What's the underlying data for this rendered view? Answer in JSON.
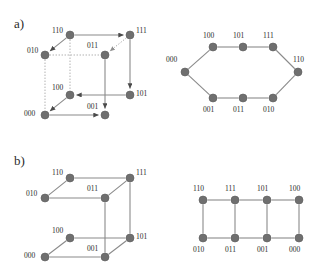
{
  "figure": {
    "width": 322,
    "height": 268,
    "background": "#ffffff",
    "node_color": "#6f6f6f",
    "edge_color": "#8a8a8a",
    "dotted_edge_color": "#a8a8a8",
    "text_color": "#2b2b2b"
  },
  "panels": {
    "a": {
      "label": "a)"
    },
    "b": {
      "label": "b)"
    }
  },
  "chart_data": [
    {
      "type": "diagram",
      "name": "panel-a-cube",
      "title": "a) directed hypercube Q3 with Hamiltonian path",
      "panel": "a",
      "position": "top-left",
      "nodes": [
        {
          "id": "110",
          "label": "110",
          "x": 70,
          "y": 35,
          "label_x": 52,
          "label_y": 33
        },
        {
          "id": "111",
          "label": "111",
          "x": 130,
          "y": 35,
          "label_x": 136,
          "label_y": 33
        },
        {
          "id": "010",
          "label": "010",
          "x": 45,
          "y": 55,
          "label_x": 27,
          "label_y": 53
        },
        {
          "id": "011",
          "label": "011",
          "x": 105,
          "y": 55,
          "label_x": 87,
          "label_y": 48
        },
        {
          "id": "100",
          "label": "100",
          "x": 70,
          "y": 95,
          "label_x": 52,
          "label_y": 90
        },
        {
          "id": "101",
          "label": "101",
          "x": 130,
          "y": 95,
          "label_x": 136,
          "label_y": 96
        },
        {
          "id": "000",
          "label": "000",
          "x": 45,
          "y": 115,
          "label_x": 24,
          "label_y": 116
        },
        {
          "id": "001",
          "label": "001",
          "x": 105,
          "y": 115,
          "label_x": 87,
          "label_y": 109
        }
      ],
      "edges": [
        {
          "from": "110",
          "to": "111",
          "style": "solid",
          "arrow": true
        },
        {
          "from": "110",
          "to": "010",
          "style": "solid",
          "arrow": true
        },
        {
          "from": "111",
          "to": "011",
          "style": "dotted",
          "arrow": true
        },
        {
          "from": "111",
          "to": "101",
          "style": "solid",
          "arrow": true
        },
        {
          "from": "011",
          "to": "001",
          "style": "solid",
          "arrow": true
        },
        {
          "from": "101",
          "to": "100",
          "style": "solid",
          "arrow": true
        },
        {
          "from": "100",
          "to": "000",
          "style": "solid",
          "arrow": true
        },
        {
          "from": "000",
          "to": "001",
          "style": "solid",
          "arrow": true
        },
        {
          "from": "010",
          "to": "000",
          "style": "dotted",
          "arrow": false
        },
        {
          "from": "110",
          "to": "100",
          "style": "dotted",
          "arrow": false
        },
        {
          "from": "010",
          "to": "011",
          "style": "dotted",
          "arrow": false
        }
      ]
    },
    {
      "type": "diagram",
      "name": "panel-a-hexagon",
      "title": "a) unfolded cycle view",
      "panel": "a",
      "position": "top-right",
      "nodes": [
        {
          "id": "000",
          "label": "000",
          "x": 185,
          "y": 72,
          "label_x": 166,
          "label_y": 62
        },
        {
          "id": "100",
          "label": "100",
          "x": 213,
          "y": 47,
          "label_x": 203,
          "label_y": 38
        },
        {
          "id": "101",
          "label": "101",
          "x": 243,
          "y": 47,
          "label_x": 233,
          "label_y": 38
        },
        {
          "id": "111",
          "label": "111",
          "x": 273,
          "y": 47,
          "label_x": 263,
          "label_y": 38
        },
        {
          "id": "110",
          "label": "110",
          "x": 298,
          "y": 72,
          "label_x": 293,
          "label_y": 62
        },
        {
          "id": "010",
          "label": "010",
          "x": 273,
          "y": 98,
          "label_x": 263,
          "label_y": 112
        },
        {
          "id": "011",
          "label": "011",
          "x": 243,
          "y": 98,
          "label_x": 233,
          "label_y": 112
        },
        {
          "id": "001",
          "label": "001",
          "x": 213,
          "y": 98,
          "label_x": 203,
          "label_y": 112
        }
      ],
      "edges": [
        {
          "from": "000",
          "to": "100",
          "style": "solid",
          "arrow": false
        },
        {
          "from": "100",
          "to": "101",
          "style": "solid",
          "arrow": false
        },
        {
          "from": "101",
          "to": "111",
          "style": "solid",
          "arrow": false
        },
        {
          "from": "111",
          "to": "110",
          "style": "solid",
          "arrow": false
        },
        {
          "from": "110",
          "to": "010",
          "style": "solid",
          "arrow": false
        },
        {
          "from": "010",
          "to": "011",
          "style": "solid",
          "arrow": false
        },
        {
          "from": "011",
          "to": "001",
          "style": "solid",
          "arrow": false
        },
        {
          "from": "001",
          "to": "000",
          "style": "solid",
          "arrow": false
        }
      ]
    },
    {
      "type": "diagram",
      "name": "panel-b-cube",
      "title": "b) cube with four edges removed",
      "panel": "b",
      "position": "bottom-left",
      "nodes": [
        {
          "id": "110",
          "label": "110",
          "x": 70,
          "y": 178,
          "label_x": 52,
          "label_y": 175
        },
        {
          "id": "111",
          "label": "111",
          "x": 130,
          "y": 178,
          "label_x": 136,
          "label_y": 175
        },
        {
          "id": "010",
          "label": "010",
          "x": 45,
          "y": 198,
          "label_x": 26,
          "label_y": 196
        },
        {
          "id": "011",
          "label": "011",
          "x": 105,
          "y": 198,
          "label_x": 87,
          "label_y": 191
        },
        {
          "id": "100",
          "label": "100",
          "x": 70,
          "y": 238,
          "label_x": 52,
          "label_y": 233
        },
        {
          "id": "101",
          "label": "101",
          "x": 130,
          "y": 238,
          "label_x": 136,
          "label_y": 239
        },
        {
          "id": "000",
          "label": "000",
          "x": 45,
          "y": 257,
          "label_x": 24,
          "label_y": 258
        },
        {
          "id": "001",
          "label": "001",
          "x": 105,
          "y": 257,
          "label_x": 87,
          "label_y": 251
        }
      ],
      "edges": [
        {
          "from": "110",
          "to": "111",
          "style": "solid",
          "arrow": false
        },
        {
          "from": "110",
          "to": "010",
          "style": "solid",
          "arrow": false
        },
        {
          "from": "010",
          "to": "011",
          "style": "solid",
          "arrow": false
        },
        {
          "from": "011",
          "to": "111",
          "style": "solid",
          "arrow": false
        },
        {
          "from": "100",
          "to": "101",
          "style": "solid",
          "arrow": false
        },
        {
          "from": "100",
          "to": "000",
          "style": "solid",
          "arrow": false
        },
        {
          "from": "000",
          "to": "001",
          "style": "solid",
          "arrow": false
        },
        {
          "from": "001",
          "to": "101",
          "style": "solid",
          "arrow": false
        },
        {
          "from": "011",
          "to": "001",
          "style": "solid",
          "arrow": false
        },
        {
          "from": "111",
          "to": "101",
          "style": "solid",
          "arrow": false
        }
      ]
    },
    {
      "type": "diagram",
      "name": "panel-b-ladder",
      "title": "b) unfolded ladder view",
      "panel": "b",
      "position": "bottom-right",
      "nodes": [
        {
          "id": "110",
          "label": "110",
          "x": 203,
          "y": 200,
          "label_x": 193,
          "label_y": 191
        },
        {
          "id": "111",
          "label": "111",
          "x": 235,
          "y": 200,
          "label_x": 225,
          "label_y": 191
        },
        {
          "id": "101",
          "label": "101",
          "x": 267,
          "y": 200,
          "label_x": 257,
          "label_y": 191
        },
        {
          "id": "100",
          "label": "100",
          "x": 299,
          "y": 200,
          "label_x": 289,
          "label_y": 191
        },
        {
          "id": "010",
          "label": "010",
          "x": 203,
          "y": 238,
          "label_x": 193,
          "label_y": 252
        },
        {
          "id": "011",
          "label": "011",
          "x": 235,
          "y": 238,
          "label_x": 225,
          "label_y": 252
        },
        {
          "id": "001",
          "label": "001",
          "x": 267,
          "y": 238,
          "label_x": 257,
          "label_y": 252
        },
        {
          "id": "000",
          "label": "000",
          "x": 299,
          "y": 238,
          "label_x": 289,
          "label_y": 252
        }
      ],
      "edges": [
        {
          "from": "110",
          "to": "111",
          "style": "solid",
          "arrow": false
        },
        {
          "from": "111",
          "to": "101",
          "style": "solid",
          "arrow": false
        },
        {
          "from": "101",
          "to": "100",
          "style": "solid",
          "arrow": false
        },
        {
          "from": "010",
          "to": "011",
          "style": "solid",
          "arrow": false
        },
        {
          "from": "011",
          "to": "001",
          "style": "solid",
          "arrow": false
        },
        {
          "from": "001",
          "to": "000",
          "style": "solid",
          "arrow": false
        },
        {
          "from": "110",
          "to": "010",
          "style": "solid",
          "arrow": false
        },
        {
          "from": "111",
          "to": "011",
          "style": "solid",
          "arrow": false
        },
        {
          "from": "101",
          "to": "001",
          "style": "solid",
          "arrow": false
        },
        {
          "from": "100",
          "to": "000",
          "style": "solid",
          "arrow": false
        }
      ]
    }
  ],
  "panel_labels": [
    {
      "name": "panel-label-a",
      "text": "a)",
      "x": 14,
      "y": 28
    },
    {
      "name": "panel-label-b",
      "text": "b)",
      "x": 14,
      "y": 165
    }
  ]
}
